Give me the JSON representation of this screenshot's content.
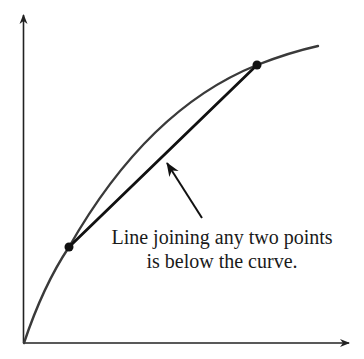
{
  "diagram": {
    "annotation": {
      "line1": "Line joining any two points",
      "line2": "is below the curve."
    },
    "colors": {
      "curve": "#3a3a3a",
      "chord": "#111111",
      "axes": "#222222",
      "points": "#111111",
      "text": "#1a1a1a",
      "background": "#ffffff"
    },
    "elements": {
      "x_axis": "horizontal axis with arrow",
      "y_axis": "vertical axis with arrow",
      "curve": "concave increasing curve from origin",
      "chord": "straight line segment between two points on curve",
      "points": [
        "lower point on curve",
        "upper point on curve"
      ],
      "pointer": "arrow pointing from label to chord"
    }
  }
}
